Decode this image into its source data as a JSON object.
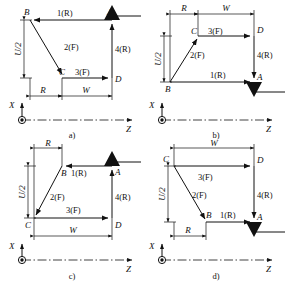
{
  "figure": {
    "axes": {
      "x_label": "X",
      "z_label": "Z",
      "origin_symbol": "y-axis-out-of-page"
    },
    "dimension_labels": {
      "u_half": "U/2",
      "radius": "R",
      "width": "W"
    }
  },
  "panels": [
    {
      "id": "a",
      "caption": "a)",
      "points": [
        {
          "name": "A",
          "label": "A",
          "pos": "top-right"
        },
        {
          "name": "B",
          "label": "B",
          "pos": "top-left"
        },
        {
          "name": "C",
          "label": "C",
          "pos": "bottom-mid"
        },
        {
          "name": "D",
          "label": "D",
          "pos": "bottom-right"
        }
      ],
      "segments": [
        {
          "id": "1",
          "label": "1(R)",
          "from": "A",
          "to": "B",
          "direction": "left",
          "type": "R"
        },
        {
          "id": "2",
          "label": "2(F)",
          "from": "B",
          "to": "C",
          "direction": "down",
          "type": "F"
        },
        {
          "id": "3",
          "label": "3(F)",
          "from": "C",
          "to": "D",
          "direction": "right",
          "type": "F"
        },
        {
          "id": "4",
          "label": "4(R)",
          "from": "D",
          "to": "A",
          "direction": "up",
          "type": "R"
        }
      ],
      "dimensions": [
        {
          "label": "U/2",
          "orientation": "vertical",
          "side": "left"
        },
        {
          "label": "R",
          "orientation": "horizontal",
          "side": "bottom"
        },
        {
          "label": "W",
          "orientation": "horizontal",
          "side": "bottom"
        }
      ],
      "ground_symbol": {
        "at": "A",
        "orientation": "above-line"
      }
    },
    {
      "id": "b",
      "caption": "b)",
      "points": [
        {
          "name": "A",
          "label": "A",
          "pos": "bottom-right"
        },
        {
          "name": "B",
          "label": "B",
          "pos": "bottom-left"
        },
        {
          "name": "C",
          "label": "C",
          "pos": "top-mid"
        },
        {
          "name": "D",
          "label": "D",
          "pos": "top-right"
        }
      ],
      "segments": [
        {
          "id": "1",
          "label": "1(R)",
          "from": "B",
          "to": "A",
          "direction": "right",
          "type": "R"
        },
        {
          "id": "2",
          "label": "2(F)",
          "from": "B",
          "to": "C",
          "direction": "up",
          "type": "F"
        },
        {
          "id": "3",
          "label": "3(F)",
          "from": "C",
          "to": "D",
          "direction": "right",
          "type": "F"
        },
        {
          "id": "4",
          "label": "4(R)",
          "from": "D",
          "to": "A",
          "direction": "down",
          "type": "R"
        }
      ],
      "dimensions": [
        {
          "label": "U/2",
          "orientation": "vertical",
          "side": "left"
        },
        {
          "label": "R",
          "orientation": "horizontal",
          "side": "top"
        },
        {
          "label": "W",
          "orientation": "horizontal",
          "side": "top"
        }
      ],
      "ground_symbol": {
        "at": "A",
        "orientation": "below-line"
      }
    },
    {
      "id": "c",
      "caption": "c)",
      "points": [
        {
          "name": "A",
          "label": "A",
          "pos": "top-right"
        },
        {
          "name": "B",
          "label": "B",
          "pos": "top-mid"
        },
        {
          "name": "C",
          "label": "C",
          "pos": "bottom-left"
        },
        {
          "name": "D",
          "label": "D",
          "pos": "bottom-right"
        }
      ],
      "segments": [
        {
          "id": "1",
          "label": "1(R)",
          "from": "A",
          "to": "B",
          "direction": "left",
          "type": "R"
        },
        {
          "id": "2",
          "label": "2(F)",
          "from": "B",
          "to": "C",
          "direction": "down",
          "type": "F"
        },
        {
          "id": "3",
          "label": "3(F)",
          "from": "C",
          "to": "D",
          "direction": "right",
          "type": "F"
        },
        {
          "id": "4",
          "label": "4(R)",
          "from": "D",
          "to": "A",
          "direction": "up",
          "type": "R"
        }
      ],
      "dimensions": [
        {
          "label": "U/2",
          "orientation": "vertical",
          "side": "left"
        },
        {
          "label": "R",
          "orientation": "horizontal",
          "side": "top"
        },
        {
          "label": "W",
          "orientation": "horizontal",
          "side": "bottom"
        }
      ],
      "ground_symbol": {
        "at": "A",
        "orientation": "above-line"
      }
    },
    {
      "id": "d",
      "caption": "d)",
      "points": [
        {
          "name": "A",
          "label": "A",
          "pos": "bottom-right"
        },
        {
          "name": "B",
          "label": "B",
          "pos": "bottom-mid"
        },
        {
          "name": "C",
          "label": "C",
          "pos": "top-left"
        },
        {
          "name": "D",
          "label": "D",
          "pos": "top-right"
        }
      ],
      "segments": [
        {
          "id": "1",
          "label": "1(R)",
          "from": "B",
          "to": "A",
          "direction": "right",
          "type": "R"
        },
        {
          "id": "2",
          "label": "2(F)",
          "from": "C",
          "to": "B",
          "direction": "down",
          "type": "F"
        },
        {
          "id": "3",
          "label": "3(F)",
          "from": "C",
          "to": "D",
          "direction": "right",
          "type": "F"
        },
        {
          "id": "4",
          "label": "4(R)",
          "from": "D",
          "to": "A",
          "direction": "down",
          "type": "R"
        }
      ],
      "dimensions": [
        {
          "label": "U/2",
          "orientation": "vertical",
          "side": "left"
        },
        {
          "label": "W",
          "orientation": "horizontal",
          "side": "top"
        },
        {
          "label": "R",
          "orientation": "horizontal",
          "side": "bottom"
        }
      ],
      "ground_symbol": {
        "at": "A",
        "orientation": "below-line"
      }
    }
  ]
}
